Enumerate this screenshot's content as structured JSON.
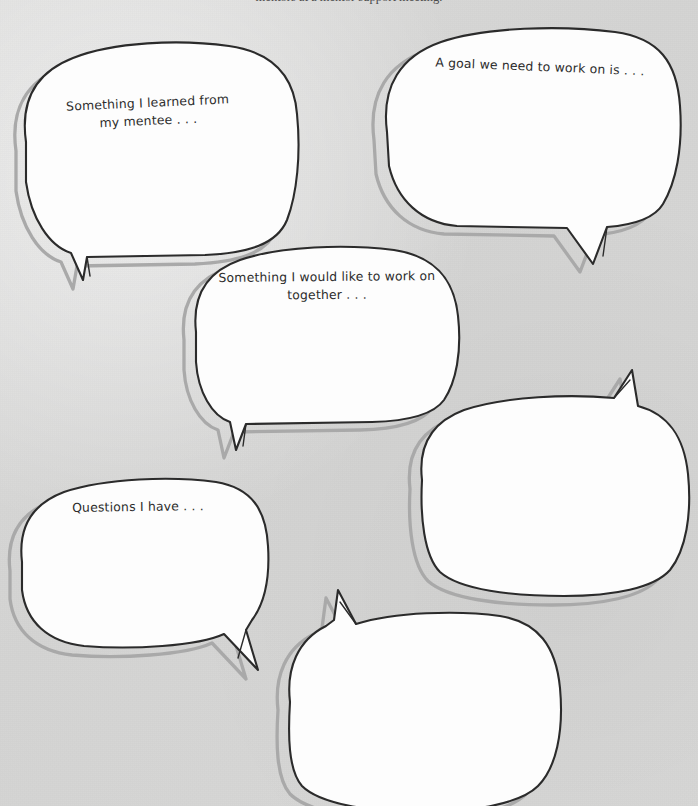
{
  "page": {
    "background_color": "#d7d7d6",
    "ink_color": "#2b2b2b",
    "shadow_color": "#9a9a9a",
    "bubble_fill": "#fdfdfd"
  },
  "caption": {
    "text": "mentors at a mentor support meeting."
  },
  "bubbles": [
    {
      "id": "bubble-mentee",
      "name": "speech-bubble-learned-from-mentee",
      "text": "Something I learned from\nmy mentee . . .",
      "has_text": true,
      "tail_direction": "down-left"
    },
    {
      "id": "bubble-goal",
      "name": "speech-bubble-goal-to-work-on",
      "text": "A goal we need to work on is . . .",
      "has_text": true,
      "tail_direction": "down"
    },
    {
      "id": "bubble-together",
      "name": "speech-bubble-work-on-together",
      "text": "Something I would like to work on\ntogether . . .",
      "has_text": true,
      "tail_direction": "down-left"
    },
    {
      "id": "bubble-questions",
      "name": "speech-bubble-questions-i-have",
      "text": "Questions I have . . .",
      "has_text": true,
      "tail_direction": "down-right"
    },
    {
      "id": "bubble-blank-right",
      "name": "speech-bubble-blank-right",
      "text": "",
      "has_text": false,
      "tail_direction": "up-right"
    },
    {
      "id": "bubble-blank-bottom",
      "name": "speech-bubble-blank-bottom",
      "text": "",
      "has_text": false,
      "tail_direction": "up-left"
    }
  ]
}
